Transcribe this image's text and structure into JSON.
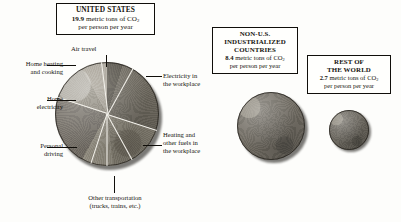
{
  "figure": {
    "type": "pie",
    "title": "",
    "units": "metric tons of CO2 per person per year"
  },
  "panels": {
    "united_states": {
      "heading": "UNITED STATES",
      "value": "19.9",
      "value_unit_prefix": "metric tons of CO",
      "value_unit_sub": "2",
      "value_unit_suffix": "per person per year"
    },
    "non_us_industrialized": {
      "heading_line1": "NON-U.S.",
      "heading_line2": "INDUSTRIALIZED",
      "heading_line3": "COUNTRIES",
      "value": "8.4",
      "value_unit_prefix": "metric tons of CO",
      "value_unit_sub": "2",
      "value_unit_suffix": "per person per year"
    },
    "rest_of_world": {
      "heading_line1": "REST OF",
      "heading_line2": "THE WORLD",
      "value": "2.7",
      "value_unit_prefix": "metric tons of CO",
      "value_unit_sub": "2",
      "value_unit_suffix": "per person per year"
    }
  },
  "labels": {
    "air_travel": "Air travel",
    "home_heating_l1": "Home heating",
    "home_heating_l2": "and cooking",
    "home_electricity_l1": "Home",
    "home_electricity_l2": "electricity",
    "personal_driving_l1": "Personal",
    "personal_driving_l2": "driving",
    "other_transport_l1": "Other transportation",
    "other_transport_l2": "(trucks, trains, etc.)",
    "electricity_workplace_l1": "Electricity in",
    "electricity_workplace_l2": "the workplace",
    "heating_workplace_l1": "Heating and",
    "heating_workplace_l2": "other fuels in",
    "heating_workplace_l3": "the workplace"
  },
  "chart_data": {
    "type": "pie",
    "title": "UNITED STATES",
    "subtitle": "19.9 metric tons of CO2 per person per year",
    "legend_position": "callout-labels",
    "grid": false,
    "categories": [
      "Air travel",
      "Electricity in the workplace",
      "Heating and other fuels in the workplace",
      "Other transportation (trucks, trains, etc.)",
      "Personal driving",
      "Home electricity",
      "Home heating and cooking"
    ],
    "values": [
      5,
      25,
      18,
      10,
      22,
      12,
      8
    ],
    "value_unit": "percent of total",
    "comparison": {
      "type": "area-scaled-circles",
      "categories": [
        "United States",
        "Non-U.S. industrialized countries",
        "Rest of the world"
      ],
      "values": [
        19.9,
        8.4,
        2.7
      ],
      "unit": "metric tons of CO2 per person per year"
    }
  },
  "colors": {
    "wedge_air_travel": "#565249",
    "wedge_electricity_workplace": "#6e6a60",
    "wedge_heating_workplace": "#8a8578",
    "wedge_other_transport": "#9b9689",
    "wedge_personal_driving": "#77726a",
    "wedge_home_electricity": "#8f8a7e",
    "wedge_home_heating": "#a6a195",
    "disc_nonus": "#6f6b62",
    "disc_row": "#6a665d",
    "separator": "#f4f2ec",
    "text": "#16140f",
    "box_border": "#100e0a"
  }
}
